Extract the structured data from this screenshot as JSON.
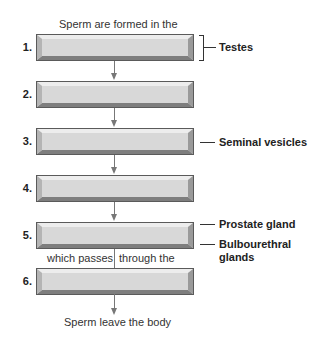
{
  "diagram": {
    "top_caption": "Sperm are formed in the",
    "steps": [
      {
        "number": "1."
      },
      {
        "number": "2."
      },
      {
        "number": "3."
      },
      {
        "number": "4."
      },
      {
        "number": "5."
      },
      {
        "number": "6."
      }
    ],
    "mid_caption_left": "which passes",
    "mid_caption_right": "through the",
    "bottom_caption": "Sperm leave the body",
    "labels": {
      "testes": "Testes",
      "seminal_vesicles": "Seminal vesicles",
      "prostate_gland": "Prostate gland",
      "bulbourethral_line1": "Bulbourethral",
      "bulbourethral_line2": "glands"
    },
    "colors": {
      "box_fill": "#d8d8d8",
      "box_border": "#5a5a5a",
      "arrow": "#777777"
    }
  }
}
